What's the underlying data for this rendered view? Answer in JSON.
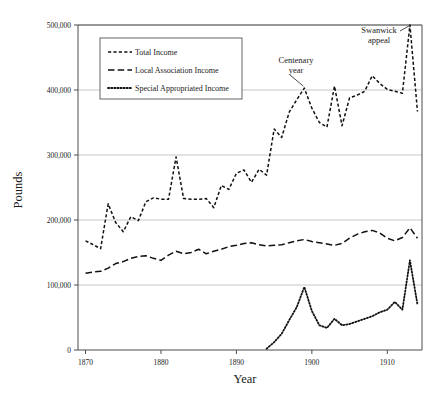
{
  "chart_data": {
    "type": "line",
    "title": "",
    "xlabel": "Year",
    "ylabel": "Pounds",
    "xlim": [
      1869.0,
      1914.6
    ],
    "ylim": [
      0,
      500000
    ],
    "grid": true,
    "legend_position": "upper-left-inside",
    "xticks": [
      1870,
      1880,
      1890,
      1900,
      1910
    ],
    "xtick_labels": [
      "1870",
      "1880",
      "1890",
      "1900",
      "1910"
    ],
    "yticks": [
      0,
      100000,
      200000,
      300000,
      400000,
      500000
    ],
    "ytick_labels": [
      "0",
      "100,000",
      "200,000",
      "300,000",
      "400,000",
      "500,000"
    ],
    "annotations": [
      {
        "text_line1": "Centenary",
        "text_line2": "year",
        "target_x": 1899,
        "target_y": 403000
      },
      {
        "text_line1": "Swanwick",
        "text_line2": "appeal",
        "target_x": 1913,
        "target_y": 500000
      }
    ],
    "series": [
      {
        "name": "Total Income",
        "dash": "short-dash",
        "x": [
          1870,
          1871,
          1872,
          1873,
          1874,
          1875,
          1876,
          1877,
          1878,
          1879,
          1880,
          1881,
          1882,
          1883,
          1884,
          1885,
          1886,
          1887,
          1888,
          1889,
          1890,
          1891,
          1892,
          1893,
          1894,
          1895,
          1896,
          1897,
          1898,
          1899,
          1900,
          1901,
          1902,
          1903,
          1904,
          1905,
          1906,
          1907,
          1908,
          1909,
          1910,
          1911,
          1912,
          1913,
          1914
        ],
        "values": [
          168000,
          162000,
          156000,
          225000,
          196000,
          182000,
          205000,
          199000,
          228000,
          234000,
          232000,
          232000,
          297000,
          233000,
          232000,
          232000,
          233000,
          219000,
          253000,
          247000,
          272000,
          277000,
          258000,
          278000,
          269000,
          340000,
          327000,
          366000,
          385000,
          403000,
          372000,
          350000,
          343000,
          406000,
          345000,
          388000,
          392000,
          398000,
          422000,
          410000,
          401000,
          398000,
          395000,
          500000,
          367000
        ]
      },
      {
        "name": "Local Association Income",
        "dash": "long-dash",
        "x": [
          1870,
          1871,
          1872,
          1873,
          1874,
          1875,
          1876,
          1877,
          1878,
          1879,
          1880,
          1881,
          1882,
          1883,
          1884,
          1885,
          1886,
          1887,
          1888,
          1889,
          1890,
          1891,
          1892,
          1893,
          1894,
          1895,
          1896,
          1897,
          1898,
          1899,
          1900,
          1901,
          1902,
          1903,
          1904,
          1905,
          1906,
          1907,
          1908,
          1909,
          1910,
          1911,
          1912,
          1913,
          1914
        ],
        "values": [
          118000,
          120000,
          121000,
          126000,
          133000,
          136000,
          141000,
          144000,
          145000,
          141000,
          138000,
          146000,
          152000,
          148000,
          150000,
          155000,
          148000,
          152000,
          155000,
          159000,
          161000,
          164000,
          165000,
          162000,
          160000,
          161000,
          162000,
          165000,
          168000,
          170000,
          167000,
          165000,
          163000,
          161000,
          164000,
          172000,
          178000,
          182000,
          184000,
          180000,
          172000,
          168000,
          173000,
          188000,
          172000
        ]
      },
      {
        "name": "Special Appropriated Income",
        "dash": "dotted",
        "x": [
          1894,
          1895,
          1896,
          1897,
          1898,
          1899,
          1900,
          1901,
          1902,
          1903,
          1904,
          1905,
          1906,
          1907,
          1908,
          1909,
          1910,
          1911,
          1912,
          1913,
          1914
        ],
        "values": [
          2000,
          12000,
          25000,
          46000,
          66000,
          97000,
          60000,
          38000,
          34000,
          48000,
          38000,
          40000,
          44000,
          48000,
          52000,
          58000,
          62000,
          74000,
          62000,
          138000,
          70000
        ]
      }
    ]
  },
  "legend": {
    "items": [
      {
        "label": "Total Income"
      },
      {
        "label": "Local Association Income"
      },
      {
        "label": "Special Appropriated Income"
      }
    ]
  },
  "axes": {
    "y_title": "Pounds",
    "x_title": "Year"
  }
}
